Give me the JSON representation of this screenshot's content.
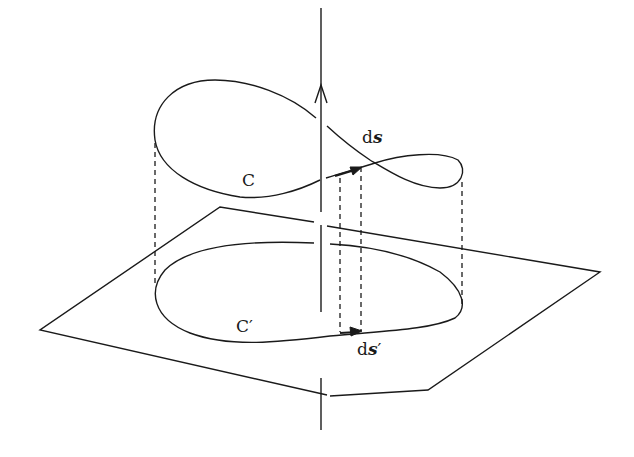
{
  "diagram": {
    "labels": {
      "curve": "C",
      "curve_projection": "C",
      "prime": "′",
      "element_d": "d",
      "element_s": "s",
      "element_proj_d": "d",
      "element_proj_s": "s",
      "element_proj_prime": "′"
    },
    "colors": {
      "stroke": "#1a1a1a",
      "background": "#ffffff"
    }
  }
}
